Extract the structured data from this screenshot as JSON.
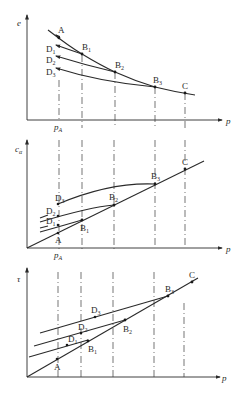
{
  "figure": {
    "panels": [
      {
        "id": "void-ratio",
        "y_axis_label": "e",
        "x_axis_label": "p",
        "x_tick_label": "p",
        "x_tick_sub": "A",
        "points": {
          "A": "A",
          "B1": "B",
          "B1s": "1",
          "B2": "B",
          "B2s": "2",
          "B3": "B",
          "B3s": "3",
          "C": "C",
          "D1": "D",
          "D1s": "1",
          "D2": "D",
          "D2s": "2",
          "D3": "D",
          "D3s": "3"
        }
      },
      {
        "id": "stress-ratio",
        "y_axis_label": "c",
        "y_axis_sub": "α",
        "x_axis_label": "p",
        "x_tick_label": "p",
        "x_tick_sub": "A",
        "points": {
          "A": "A",
          "B1": "B",
          "B1s": "1",
          "B2": "B",
          "B2s": "2",
          "B3": "B",
          "B3s": "3",
          "C": "C",
          "D1": "D",
          "D1s": "1",
          "D2": "D",
          "D2s": "2",
          "D3": "D",
          "D3s": "3"
        }
      },
      {
        "id": "shear-strength",
        "y_axis_label": "τ",
        "x_axis_label": "p",
        "points": {
          "A": "A",
          "B1": "B",
          "B1s": "1",
          "B2": "B",
          "B2s": "2",
          "B3": "B",
          "B3s": "3",
          "C": "C",
          "D1": "D",
          "D1s": "1",
          "D2": "D",
          "D2s": "2",
          "D3": "D",
          "D3s": "3"
        }
      }
    ]
  }
}
